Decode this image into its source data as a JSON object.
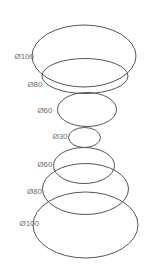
{
  "diagram": {
    "type": "technical-drawing-stacked-ellipses",
    "background": "#ffffff",
    "stroke_color": "#555555",
    "stroke_width": 1,
    "label_color": "#6e6e6e",
    "label_font_size": 8,
    "ellipses": [
      {
        "label": "Ø100",
        "diameter": 100,
        "cx": 84,
        "cy": 56,
        "rx": 52,
        "ry": 31,
        "label_x": 34,
        "label_y": 58.5
      },
      {
        "label": "Ø80",
        "diameter": 80,
        "cx": 85,
        "cy": 76,
        "rx": 43,
        "ry": 17.5,
        "label_x": 42.5,
        "label_y": 87
      },
      {
        "label": "Ø60",
        "diameter": 60,
        "cx": 87,
        "cy": 109.5,
        "rx": 29.5,
        "ry": 17,
        "label_x": 52.5,
        "label_y": 112.5
      },
      {
        "label": "Ø30",
        "diameter": 30,
        "cx": 84.5,
        "cy": 137.5,
        "rx": 16,
        "ry": 10,
        "label_x": 67.5,
        "label_y": 139
      },
      {
        "label": "Ø60",
        "diameter": 60,
        "cx": 84,
        "cy": 165.5,
        "rx": 30.5,
        "ry": 18,
        "label_x": 52.5,
        "label_y": 166.5
      },
      {
        "label": "Ø80",
        "diameter": 80,
        "cx": 85.5,
        "cy": 189,
        "rx": 43,
        "ry": 25.5,
        "label_x": 42,
        "label_y": 194
      },
      {
        "label": "Ø100",
        "diameter": 100,
        "cx": 85.5,
        "cy": 225,
        "rx": 52.5,
        "ry": 33,
        "label_x": 39,
        "label_y": 225.5
      }
    ]
  }
}
